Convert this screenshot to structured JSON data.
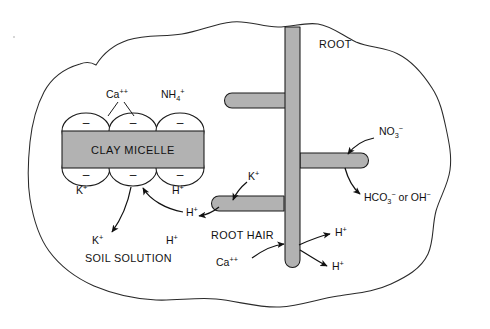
{
  "figure": {
    "soil_region_label": "SOIL SOLUTION",
    "micelle_label": "CLAY MICELLE",
    "root_label": "ROOT",
    "root_hair_label": "ROOT HAIR"
  },
  "colors": {
    "root_gray": "#b2b2b2",
    "micelle_gray": "#b2b2b2",
    "outline": "#2a2a2a",
    "text": "#111111",
    "background": "#ffffff"
  },
  "micelle": {
    "charge_sign": "–",
    "top_nodes": 3,
    "bottom_nodes": 3,
    "adsorbed_ions": {
      "top": [
        {
          "id": "ca",
          "base": "Ca",
          "sup": "++",
          "x": 118,
          "y": 95
        },
        {
          "id": "nh4",
          "base": "NH",
          "sub": "4",
          "sup": "+",
          "x": 172,
          "y": 95
        }
      ],
      "bottom": [
        {
          "id": "k",
          "base": "K",
          "sup": "+",
          "x": 82,
          "y": 190
        },
        {
          "id": "h",
          "base": "H",
          "sup": "+",
          "x": 178,
          "y": 190
        }
      ]
    }
  },
  "ions": {
    "k_released": {
      "base": "K",
      "sup": "+",
      "x": 98,
      "y": 240
    },
    "h_incoming": {
      "base": "H",
      "sup": "+",
      "x": 188,
      "y": 215
    },
    "h_solution": {
      "base": "H",
      "sup": "+",
      "x": 172,
      "y": 241
    },
    "k_uptake": {
      "base": "K",
      "sup": "+",
      "x": 244,
      "y": 188
    },
    "ca_uptake": {
      "base": "Ca",
      "sup": "++",
      "x": 228,
      "y": 265
    },
    "h_efflux_upper": {
      "base": "H",
      "sup": "+",
      "x": 338,
      "y": 238
    },
    "h_efflux_lower": {
      "base": "H",
      "sup": "+",
      "x": 336,
      "y": 268
    },
    "no3_uptake": {
      "base": "NO",
      "sub": "3",
      "sup": "−",
      "x": 382,
      "y": 141
    },
    "hco3_efflux": {
      "base": "HCO",
      "sub": "3",
      "sup": "−",
      "suffix": " or OH",
      "sup2": "−",
      "x": 366,
      "y": 200
    }
  },
  "captions": {
    "bottom_cut_text": ""
  }
}
